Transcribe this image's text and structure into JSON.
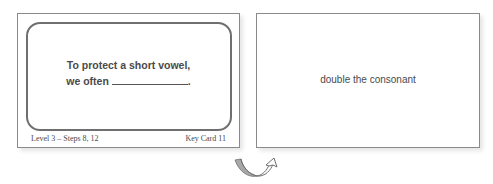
{
  "front_card": {
    "prompt_line_1": "To protect a short vowel,",
    "prompt_line_2": "we often",
    "prompt_end": ".",
    "footer_left": "Level 3 – Steps 8, 12",
    "footer_right": "Key Card 11"
  },
  "back_card": {
    "answer": "double the consonant"
  },
  "flip_indicator": {
    "icon": "flip-curl-arrow-icon"
  },
  "colors": {
    "card_border": "#8a8a8a",
    "inner_frame": "#6f6f6f",
    "text": "#4a4a4a",
    "arrow_fill": "#a8a8a8"
  }
}
